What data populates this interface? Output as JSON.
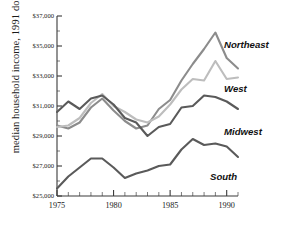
{
  "chart_data": {
    "type": "line",
    "title": "",
    "xlabel": "",
    "ylabel": "median household income, 1991 dollars",
    "xlim": [
      1975,
      1991
    ],
    "ylim": [
      25000,
      37000
    ],
    "grid": false,
    "legend_position": "right-inline",
    "y_ticks": [
      25000,
      27000,
      29000,
      31000,
      33000,
      35000,
      37000
    ],
    "y_tick_labels": [
      "$25,000",
      "$27,000",
      "$29,000",
      "$31,000",
      "$33,000",
      "$35,000",
      "$37,000"
    ],
    "x_ticks": [
      1975,
      1976,
      1977,
      1978,
      1979,
      1980,
      1981,
      1982,
      1983,
      1984,
      1985,
      1986,
      1987,
      1988,
      1989,
      1990,
      1991
    ],
    "x_tick_labels_shown": [
      "1975",
      "1980",
      "1985",
      "1990"
    ],
    "x_labeled_ticks": [
      1975,
      1980,
      1985,
      1990
    ],
    "x": [
      1975,
      1976,
      1977,
      1978,
      1979,
      1980,
      1981,
      1982,
      1983,
      1984,
      1985,
      1986,
      1987,
      1988,
      1989,
      1990,
      1991
    ],
    "series": [
      {
        "name": "Northeast",
        "color": "#8c8c8c",
        "values": [
          29700,
          29500,
          29900,
          30900,
          31500,
          30700,
          30000,
          29500,
          29700,
          30800,
          31400,
          32700,
          33800,
          34800,
          35900,
          34200,
          33500
        ]
      },
      {
        "name": "West",
        "color": "#bdbdbd",
        "values": [
          29600,
          29700,
          30200,
          31200,
          31800,
          31000,
          30600,
          30100,
          29900,
          30300,
          31100,
          32100,
          32800,
          32700,
          34000,
          32800,
          32900
        ]
      },
      {
        "name": "Midwest",
        "color": "#5a5a5a",
        "values": [
          30600,
          31300,
          30800,
          31500,
          31700,
          31100,
          30200,
          29900,
          29000,
          29600,
          29800,
          30900,
          31000,
          31700,
          31600,
          31300,
          30800
        ]
      },
      {
        "name": "South",
        "color": "#5a5a5a",
        "values": [
          25500,
          26300,
          26900,
          27500,
          27500,
          26900,
          26200,
          26500,
          26700,
          27000,
          27100,
          28100,
          28800,
          28400,
          28500,
          28300,
          27600
        ]
      }
    ]
  },
  "labels": {
    "northeast": "Northeast",
    "west": "West",
    "midwest": "Midwest",
    "south": "South"
  },
  "axis": {
    "y_title": "median household income, 1991 dollars"
  }
}
